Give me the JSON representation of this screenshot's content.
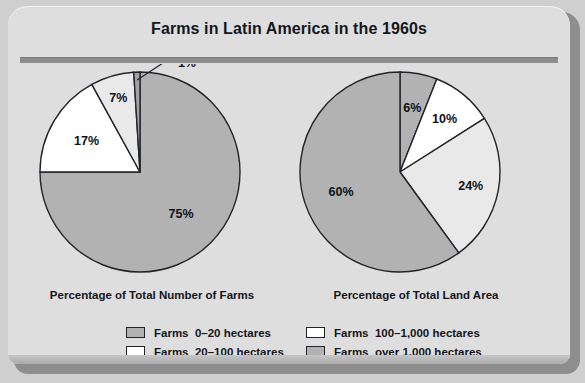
{
  "title": "Farms in Latin America in the 1960s",
  "colors": {
    "panel_background": "#dedede",
    "page_background": "#cfcfcf",
    "outline": "#22242a",
    "gray": "#b2b2b2",
    "light_gray": "#e9e9e9",
    "white": "#ffffff",
    "rule": "#8d8d8d"
  },
  "legend": {
    "columns": [
      {
        "items": [
          {
            "swatch": "#b2b2b2",
            "label": "Farms  0–20 hectares"
          },
          {
            "swatch": "#ffffff",
            "label": "Farms  20–100 hectares"
          }
        ]
      },
      {
        "items": [
          {
            "swatch": "#ffffff",
            "label": "Farms  100–1,000 hectares"
          },
          {
            "swatch": "#b2b2b2",
            "label": "Farms  over 1,000 hectares"
          }
        ]
      }
    ]
  },
  "chart_data": [
    {
      "type": "pie",
      "title": "Percentage of Total Number of Farms",
      "categories": [
        "Farms 0–20 hectares",
        "Farms 20–100 hectares",
        "Farms 100–1,000 hectares",
        "Farms over 1,000 hectares"
      ],
      "values": [
        75,
        17,
        7,
        1
      ],
      "labels": [
        "75%",
        "17%",
        "7%",
        "1%"
      ],
      "slice_colors": [
        "#b2b2b2",
        "#ffffff",
        "#e9e9e9",
        "#a2a2a2"
      ],
      "start_angle_deg": 0,
      "direction": "clockwise",
      "units": "percent",
      "legend_position": "below"
    },
    {
      "type": "pie",
      "title": "Percentage of Total Land Area",
      "categories": [
        "Farms 0–20 hectares",
        "Farms 20–100 hectares",
        "Farms 100–1,000 hectares",
        "Farms over 1,000 hectares"
      ],
      "values": [
        6,
        10,
        24,
        60
      ],
      "labels": [
        "6%",
        "10%",
        "24%",
        "60%"
      ],
      "slice_colors": [
        "#b2b2b2",
        "#ffffff",
        "#e9e9e9",
        "#b2b2b2"
      ],
      "start_angle_deg": 0,
      "direction": "clockwise",
      "units": "percent",
      "legend_position": "below"
    }
  ]
}
